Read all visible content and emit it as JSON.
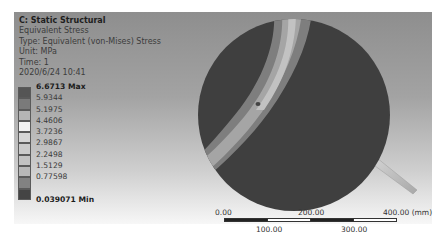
{
  "viewport": {
    "info": {
      "title": "C: Static Structural",
      "result": "Equivalent Stress",
      "type": "Type: Equivalent (von-Mises) Stress",
      "unit": "Unit: MPa",
      "time": "Time: 1",
      "date": "2020/6/24 10:41"
    },
    "legend": {
      "entries": [
        {
          "label": "6.6713 Max",
          "swatch": "#555555"
        },
        {
          "label": "5.9344",
          "swatch": "#7a7a7a"
        },
        {
          "label": "5.1975",
          "swatch": "#b5b5b5"
        },
        {
          "label": "4.4606",
          "swatch": "#f2f2f2"
        },
        {
          "label": "3.7236",
          "swatch": "#d6d6d6"
        },
        {
          "label": "2.9867",
          "swatch": "#cbcbcb"
        },
        {
          "label": "2.2498",
          "swatch": "#c2c2c2"
        },
        {
          "label": "1.5129",
          "swatch": "#b8b8b8"
        },
        {
          "label": "0.77598",
          "swatch": "#828282"
        },
        {
          "label": "",
          "swatch": "#444444"
        }
      ],
      "min_label": "0.039071 Min"
    },
    "scale_bar": {
      "top_labels": [
        "0.00",
        "200.00",
        "400.00 (mm)"
      ],
      "bottom_labels": [
        "100.00",
        "300.00"
      ]
    }
  }
}
